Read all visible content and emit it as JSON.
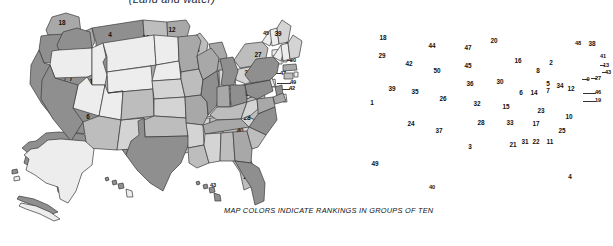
{
  "header": {
    "title": "(Land and water)"
  },
  "footer": {
    "caption": "MAP COLORS INDICATE RANKINGS IN GROUPS OF TEN"
  },
  "legend": {
    "note": "Shading groups ranks 1-10, 11-20, 21-30, 31-40, 41-50",
    "colors": {
      "group_1_10": "#8f8f8f",
      "group_11_20": "#a8a8a8",
      "group_21_30": "#bdbdbd",
      "group_31_40": "#d4d4d4",
      "group_41_50": "#ededed",
      "outline": "#3a3a3a",
      "text": "#111111",
      "background": "#ffffff"
    }
  },
  "maps": [
    {
      "id": "left-map",
      "name": "total-area-rank-map",
      "states": [
        {
          "code": "WA",
          "rank": 18,
          "x": 62,
          "y": 23
        },
        {
          "code": "OR",
          "rank": 9,
          "x": 60,
          "y": 44
        },
        {
          "code": "CA",
          "rank": 3,
          "x": 49,
          "y": 93
        },
        {
          "code": "NV",
          "rank": 7,
          "x": 71,
          "y": 79
        },
        {
          "code": "ID",
          "rank": 14,
          "x": 87,
          "y": 52
        },
        {
          "code": "MT",
          "rank": 4,
          "x": 110,
          "y": 35
        },
        {
          "code": "WY",
          "rank": 10,
          "x": 114,
          "y": 60
        },
        {
          "code": "UT",
          "rank": 13,
          "x": 93,
          "y": 82
        },
        {
          "code": "AZ",
          "rank": 6,
          "x": 88,
          "y": 117
        },
        {
          "code": "NM",
          "rank": 5,
          "x": 117,
          "y": 123
        },
        {
          "code": "CO",
          "rank": 8,
          "x": 121,
          "y": 88
        },
        {
          "code": "ND",
          "rank": 19,
          "x": 146,
          "y": 38
        },
        {
          "code": "SD",
          "rank": 17,
          "x": 146,
          "y": 56
        },
        {
          "code": "NE",
          "rank": 16,
          "x": 148,
          "y": 73
        },
        {
          "code": "KS",
          "rank": 15,
          "x": 155,
          "y": 94
        },
        {
          "code": "OK",
          "rank": 20,
          "x": 159,
          "y": 113
        },
        {
          "code": "TX",
          "rank": 2,
          "x": 148,
          "y": 148
        },
        {
          "code": "MN",
          "rank": 12,
          "x": 172,
          "y": 30
        },
        {
          "code": "IA",
          "rank": 26,
          "x": 178,
          "y": 72
        },
        {
          "code": "MO",
          "rank": 21,
          "x": 184,
          "y": 97
        },
        {
          "code": "AR",
          "rank": 29,
          "x": 188,
          "y": 126
        },
        {
          "code": "LA",
          "rank": 31,
          "x": 191,
          "y": 145
        },
        {
          "code": "WI",
          "rank": 23,
          "x": 196,
          "y": 50
        },
        {
          "code": "IL",
          "rank": 25,
          "x": 199,
          "y": 83
        },
        {
          "code": "MS",
          "rank": 32,
          "x": 203,
          "y": 143
        },
        {
          "code": "MI",
          "rank": 11,
          "x": 216,
          "y": 60
        },
        {
          "code": "IN",
          "rank": 38,
          "x": 212,
          "y": 83
        },
        {
          "code": "AL",
          "rank": 30,
          "x": 214,
          "y": 143
        },
        {
          "code": "TN",
          "rank": 36,
          "x": 214,
          "y": 125
        },
        {
          "code": "KY",
          "rank": 37,
          "x": 219,
          "y": 102
        },
        {
          "code": "OH",
          "rank": 34,
          "x": 226,
          "y": 81
        },
        {
          "code": "GA",
          "rank": 24,
          "x": 228,
          "y": 143
        },
        {
          "code": "WV",
          "rank": 41,
          "x": 238,
          "y": 91
        },
        {
          "code": "SC",
          "rank": 40,
          "x": 240,
          "y": 131
        },
        {
          "code": "NC",
          "rank": 28,
          "x": 247,
          "y": 118
        },
        {
          "code": "VA",
          "rank": 35,
          "x": 249,
          "y": 94
        },
        {
          "code": "PA",
          "rank": 33,
          "x": 248,
          "y": 73
        },
        {
          "code": "NY",
          "rank": 27,
          "x": 258,
          "y": 55
        },
        {
          "code": "VT",
          "rank": 45,
          "x": 266,
          "y": 34
        },
        {
          "code": "ME",
          "rank": 39,
          "x": 278,
          "y": 34
        },
        {
          "code": "NH",
          "rank": 46,
          "x": 285,
          "y": 45
        },
        {
          "code": "MA",
          "rank": 44,
          "x": 288,
          "y": 55
        },
        {
          "code": "RI",
          "rank": 50,
          "x": 290,
          "y": 62
        },
        {
          "code": "CT",
          "rank": 48,
          "x": 283,
          "y": 66
        },
        {
          "code": "NJ",
          "rank": 47,
          "x": 276,
          "y": 69
        },
        {
          "code": "DE",
          "rank": 49,
          "x": 285,
          "y": 82
        },
        {
          "code": "MD",
          "rank": 42,
          "x": 284,
          "y": 88
        },
        {
          "code": "FL",
          "rank": 22,
          "x": 247,
          "y": 177
        },
        {
          "code": "AK",
          "rank": 1,
          "x": 63,
          "y": 166
        },
        {
          "code": "HI",
          "rank": 43,
          "x": 213,
          "y": 189
        }
      ]
    },
    {
      "id": "right-map",
      "name": "population-rank-map",
      "states": [
        {
          "code": "WA",
          "rank": 18,
          "x": 383,
          "y": 38
        },
        {
          "code": "OR",
          "rank": 29,
          "x": 382,
          "y": 56
        },
        {
          "code": "CA",
          "rank": 1,
          "x": 372,
          "y": 103
        },
        {
          "code": "NV",
          "rank": 39,
          "x": 392,
          "y": 89
        },
        {
          "code": "ID",
          "rank": 42,
          "x": 409,
          "y": 64
        },
        {
          "code": "MT",
          "rank": 44,
          "x": 432,
          "y": 46
        },
        {
          "code": "WY",
          "rank": 50,
          "x": 437,
          "y": 71
        },
        {
          "code": "UT",
          "rank": 35,
          "x": 415,
          "y": 92
        },
        {
          "code": "AZ",
          "rank": 24,
          "x": 411,
          "y": 124
        },
        {
          "code": "NM",
          "rank": 37,
          "x": 439,
          "y": 131
        },
        {
          "code": "CO",
          "rank": 26,
          "x": 443,
          "y": 99
        },
        {
          "code": "ND",
          "rank": 47,
          "x": 468,
          "y": 48
        },
        {
          "code": "SD",
          "rank": 45,
          "x": 468,
          "y": 66
        },
        {
          "code": "NE",
          "rank": 36,
          "x": 470,
          "y": 84
        },
        {
          "code": "KS",
          "rank": 32,
          "x": 477,
          "y": 104
        },
        {
          "code": "OK",
          "rank": 28,
          "x": 481,
          "y": 123
        },
        {
          "code": "TX",
          "rank": 3,
          "x": 470,
          "y": 147
        },
        {
          "code": "MN",
          "rank": 20,
          "x": 494,
          "y": 41
        },
        {
          "code": "IA",
          "rank": 30,
          "x": 500,
          "y": 82
        },
        {
          "code": "MO",
          "rank": 15,
          "x": 506,
          "y": 107
        },
        {
          "code": "AR",
          "rank": 33,
          "x": 510,
          "y": 123
        },
        {
          "code": "LA",
          "rank": 21,
          "x": 513,
          "y": 145
        },
        {
          "code": "WI",
          "rank": 16,
          "x": 518,
          "y": 61
        },
        {
          "code": "IL",
          "rank": 6,
          "x": 521,
          "y": 93
        },
        {
          "code": "MS",
          "rank": 31,
          "x": 525,
          "y": 142
        },
        {
          "code": "MI",
          "rank": 8,
          "x": 538,
          "y": 71
        },
        {
          "code": "IN",
          "rank": 14,
          "x": 534,
          "y": 93
        },
        {
          "code": "AL",
          "rank": 22,
          "x": 536,
          "y": 142
        },
        {
          "code": "TN",
          "rank": 17,
          "x": 536,
          "y": 124
        },
        {
          "code": "KY",
          "rank": 23,
          "x": 541,
          "y": 111
        },
        {
          "code": "OH",
          "rank": 7,
          "x": 548,
          "y": 91
        },
        {
          "code": "GA",
          "rank": 11,
          "x": 550,
          "y": 142
        },
        {
          "code": "WV",
          "rank": 34,
          "x": 560,
          "y": 86
        },
        {
          "code": "SC",
          "rank": 25,
          "x": 562,
          "y": 131
        },
        {
          "code": "NC",
          "rank": 10,
          "x": 569,
          "y": 117
        },
        {
          "code": "VA",
          "rank": 12,
          "x": 571,
          "y": 89
        },
        {
          "code": "PA",
          "rank": 5,
          "x": 548,
          "y": 84
        },
        {
          "code": "NY",
          "rank": 2,
          "x": 551,
          "y": 63
        },
        {
          "code": "VT",
          "rank": 48,
          "x": 578,
          "y": 44
        },
        {
          "code": "ME",
          "rank": 38,
          "x": 592,
          "y": 44
        },
        {
          "code": "NH",
          "rank": 41,
          "x": 600,
          "y": 57
        },
        {
          "code": "MA",
          "rank": 13,
          "x": 603,
          "y": 66
        },
        {
          "code": "RI",
          "rank": 43,
          "x": 606,
          "y": 73
        },
        {
          "code": "CT",
          "rank": 27,
          "x": 597,
          "y": 78
        },
        {
          "code": "NJ",
          "rank": 9,
          "x": 588,
          "y": 80
        },
        {
          "code": "DE",
          "rank": 46,
          "x": 597,
          "y": 93
        },
        {
          "code": "MD",
          "rank": 19,
          "x": 597,
          "y": 101
        },
        {
          "code": "FL",
          "rank": 4,
          "x": 570,
          "y": 177
        },
        {
          "code": "AK",
          "rank": 49,
          "x": 375,
          "y": 164
        },
        {
          "code": "HI",
          "rank": 40,
          "x": 432,
          "y": 185
        }
      ]
    }
  ]
}
